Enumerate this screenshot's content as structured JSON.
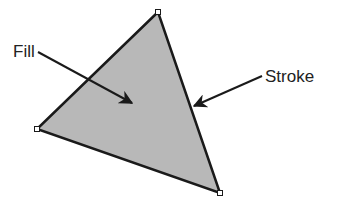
{
  "diagram": {
    "shape": "triangle",
    "fill_color": "#b8b8b8",
    "stroke_color": "#1a1a1a",
    "labels": {
      "fill": "Fill",
      "stroke": "Stroke"
    },
    "anchor_points": 3
  }
}
